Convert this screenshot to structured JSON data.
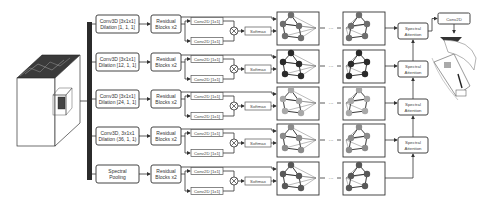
{
  "branches": [
    {
      "conv3d_line1": "Conv3D [3x1x1]",
      "conv3d_line2": "Dilation [1, 1, 1]",
      "residual_line1": "Residual",
      "residual_line2": "Blocks x2",
      "conv2d_top": "Conv2D [1x1]",
      "conv2d_bottom": "Conv2D [1x1]",
      "softmax": "Softmax",
      "node_color": "#6e6e6e"
    },
    {
      "conv3d_line1": "Conv3D [3x1x1]",
      "conv3d_line2": "Dilation [12, 1, 1]",
      "residual_line1": "Residual",
      "residual_line2": "Blocks x2",
      "conv2d_top": "Conv2D [1x1]",
      "conv2d_bottom": "Conv2D [1x1]",
      "softmax": "Softmax",
      "node_color": "#2a2a2a"
    },
    {
      "conv3d_line1": "Conv3D [3x1x1]",
      "conv3d_line2": "Dilation [24, 1, 1]",
      "residual_line1": "Residual",
      "residual_line2": "Blocks x2",
      "conv2d_top": "Conv2D [1x1]",
      "conv2d_bottom": "Conv2D [1x1]",
      "softmax": "Softmax",
      "node_color": "#a8a8a8"
    },
    {
      "conv3d_line1": "Conv3D, 3x1x1",
      "conv3d_line2": "Dilation (36, 1, 1)",
      "residual_line1": "Residual",
      "residual_line2": "Blocks x2",
      "conv2d_top": "Conv2D [1x1]",
      "conv2d_bottom": "Conv2D [1x1]",
      "softmax": "Softmax",
      "node_color": "#8c8c8c"
    },
    {
      "conv3d_line1": "Spectral",
      "conv3d_line2": "Pooling",
      "residual_line1": "Residual",
      "residual_line2": "Blocks x2",
      "conv2d_top": "Conv2D [1x1]",
      "conv2d_bottom": "Conv2D [1x1]",
      "softmax": "Softmax",
      "node_color": "#585858"
    }
  ],
  "spectral_attention": [
    {
      "line1": "Spectral",
      "line2": "Attention"
    },
    {
      "line1": "Spectral",
      "line2": "Attention"
    },
    {
      "line1": "Spectral",
      "line2": "Attention"
    },
    {
      "line1": "Spectral",
      "line2": "Attention"
    }
  ],
  "output": {
    "conv2d_label": "Conv2D"
  },
  "ellipsis": "···",
  "multiply_symbol": "⊗"
}
